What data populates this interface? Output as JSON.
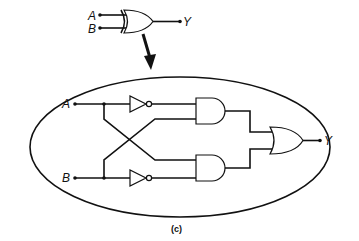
{
  "diagram": {
    "title_symbol": {
      "type": "XOR gate",
      "inputs": [
        "A",
        "B"
      ],
      "output": "Y"
    },
    "expanded_circuit": {
      "inputs": [
        "A",
        "B"
      ],
      "output": "Y",
      "gates": [
        "NOT (A)",
        "NOT (B)",
        "AND (upper)",
        "AND (lower)",
        "OR"
      ],
      "description": "XOR implemented as (A AND NOT B) OR (NOT A AND B)"
    },
    "caption": "(c)",
    "colors": {
      "line": "#111111",
      "background": "#ffffff"
    }
  }
}
